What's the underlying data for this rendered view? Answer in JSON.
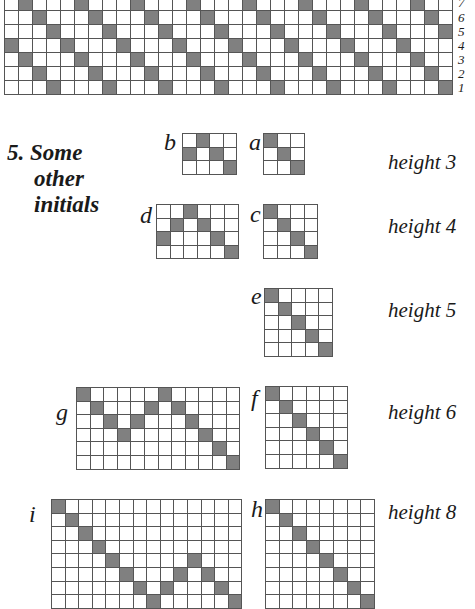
{
  "top_chart": {
    "description": "Repeating diagonal threading draft, 7 rows (shafts) numbered from bottom",
    "rows": 7,
    "cols": 32,
    "row_labels": [
      "7",
      "6",
      "5",
      "4",
      "3",
      "2",
      "1"
    ],
    "filled": {
      "7": [
        2,
        6,
        10,
        14,
        18,
        22,
        26,
        30
      ],
      "6": [
        3,
        7,
        11,
        15,
        19,
        23,
        27,
        31
      ],
      "5": [
        4,
        8,
        12,
        16,
        20,
        24,
        28,
        32
      ],
      "4": [
        1,
        5,
        9,
        13,
        17,
        21,
        25,
        29
      ],
      "3": [
        2,
        6,
        10,
        14,
        18,
        22,
        26,
        30
      ],
      "2": [
        3,
        7,
        11,
        15,
        19,
        23,
        27,
        31
      ],
      "1": [
        4,
        8,
        12,
        16,
        20,
        24,
        28,
        32
      ]
    }
  },
  "section": {
    "number": "5.",
    "title_lines": [
      "Some",
      "other",
      "initials"
    ]
  },
  "initials": [
    {
      "letter": "b",
      "rows": 3,
      "cols": 4,
      "filled": [
        [
          1,
          2
        ],
        [
          2,
          1
        ],
        [
          2,
          3
        ],
        [
          3,
          4
        ]
      ]
    },
    {
      "letter": "a",
      "rows": 3,
      "cols": 3,
      "filled": [
        [
          1,
          1
        ],
        [
          2,
          2
        ],
        [
          3,
          3
        ]
      ]
    },
    {
      "letter": "d",
      "rows": 4,
      "cols": 6,
      "filled": [
        [
          1,
          3
        ],
        [
          2,
          2
        ],
        [
          2,
          4
        ],
        [
          3,
          1
        ],
        [
          3,
          5
        ],
        [
          4,
          6
        ]
      ]
    },
    {
      "letter": "c",
      "rows": 4,
      "cols": 4,
      "filled": [
        [
          1,
          1
        ],
        [
          2,
          2
        ],
        [
          3,
          3
        ],
        [
          4,
          4
        ]
      ]
    },
    {
      "letter": "e",
      "rows": 5,
      "cols": 5,
      "filled": [
        [
          1,
          1
        ],
        [
          2,
          2
        ],
        [
          3,
          3
        ],
        [
          4,
          4
        ],
        [
          5,
          5
        ]
      ]
    },
    {
      "letter": "g",
      "rows": 6,
      "cols": 12,
      "filled": [
        [
          1,
          1
        ],
        [
          1,
          7
        ],
        [
          2,
          2
        ],
        [
          2,
          6
        ],
        [
          2,
          8
        ],
        [
          3,
          3
        ],
        [
          3,
          5
        ],
        [
          3,
          9
        ],
        [
          4,
          4
        ],
        [
          4,
          10
        ],
        [
          5,
          11
        ],
        [
          6,
          12
        ]
      ]
    },
    {
      "letter": "f",
      "rows": 6,
      "cols": 6,
      "filled": [
        [
          1,
          1
        ],
        [
          2,
          2
        ],
        [
          3,
          3
        ],
        [
          4,
          4
        ],
        [
          5,
          5
        ],
        [
          6,
          6
        ]
      ]
    },
    {
      "letter": "i",
      "rows": 8,
      "cols": 14,
      "filled": [
        [
          1,
          1
        ],
        [
          2,
          2
        ],
        [
          3,
          3
        ],
        [
          4,
          4
        ],
        [
          5,
          5
        ],
        [
          5,
          11
        ],
        [
          6,
          6
        ],
        [
          6,
          10
        ],
        [
          6,
          12
        ],
        [
          7,
          7
        ],
        [
          7,
          9
        ],
        [
          7,
          13
        ],
        [
          8,
          8
        ],
        [
          8,
          14
        ]
      ]
    },
    {
      "letter": "h",
      "rows": 8,
      "cols": 8,
      "filled": [
        [
          1,
          1
        ],
        [
          2,
          2
        ],
        [
          3,
          3
        ],
        [
          4,
          4
        ],
        [
          5,
          5
        ],
        [
          6,
          6
        ],
        [
          7,
          7
        ],
        [
          8,
          8
        ]
      ]
    }
  ],
  "height_labels": [
    "height 3",
    "height 4",
    "height 5",
    "height 6",
    "height 8"
  ],
  "colors": {
    "filled_cell": "#808080",
    "grid_line": "#555555",
    "background": "#ffffff"
  }
}
